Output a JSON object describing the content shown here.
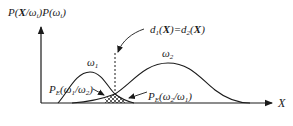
{
  "diagram": {
    "y_axis_label": {
      "P": "P(",
      "X": "X",
      "mid": "/ω",
      "sub1": "i",
      "mid2": ")P(ω",
      "sub2": "i",
      "end": ")"
    },
    "x_axis_label": "X",
    "boundary_label": {
      "d1": "d",
      "sub1": "1",
      "open1": "(",
      "X1": "X",
      "eq": ")=d",
      "sub2": "2",
      "open2": "(",
      "X2": "X",
      "close": ")"
    },
    "class1_label": {
      "omega": "ω",
      "sub": "1"
    },
    "class2_label": {
      "omega": "ω",
      "sub": "2"
    },
    "error1_label": {
      "P": "P",
      "sub": "E",
      "body": "(ω",
      "s1": "1",
      "slash": "/ω",
      "s2": "2",
      "close": ")"
    },
    "error2_label": {
      "P": "P",
      "sub": "E",
      "body": "(ω",
      "s1": "2",
      "slash": "/ω",
      "s2": "1",
      "close": ")"
    },
    "colors": {
      "ink": "#1a1a1a",
      "background": "#ffffff"
    }
  }
}
